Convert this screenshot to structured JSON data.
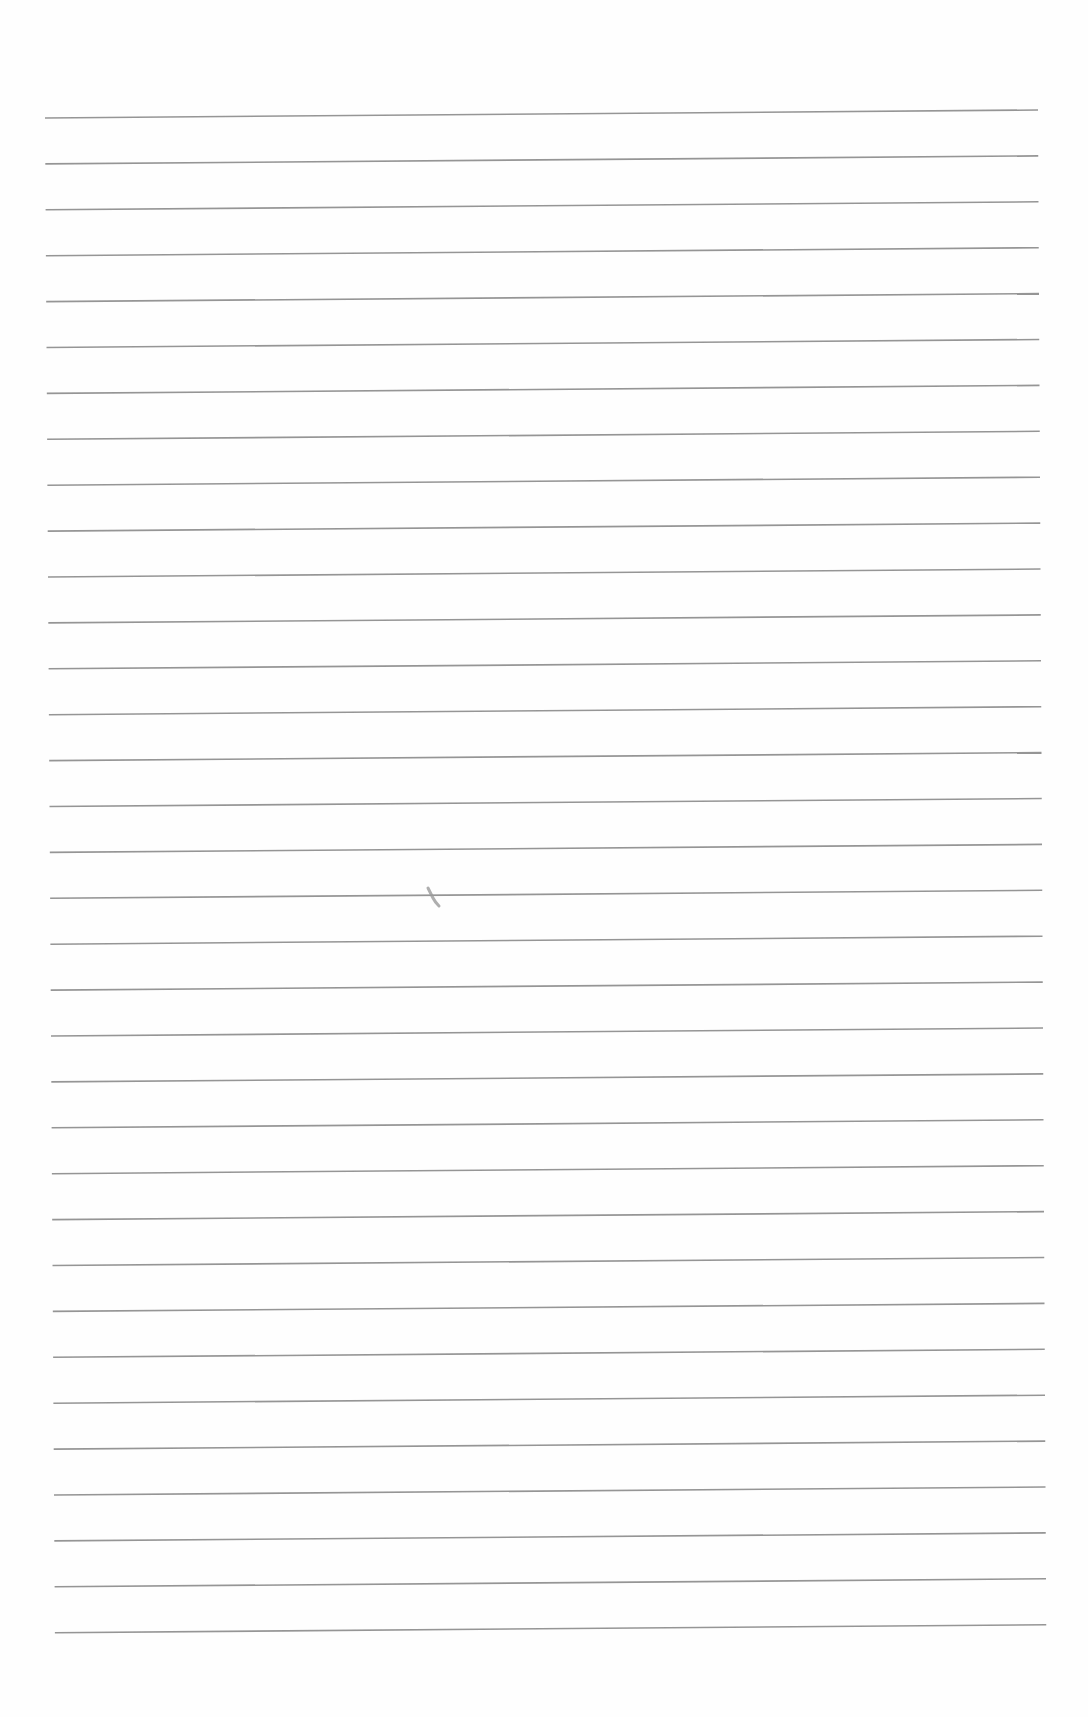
{
  "page": {
    "type": "lined-notebook-paper",
    "background_color": "#fefefe",
    "rule_color": "#8a8a8a",
    "rule_count": 34,
    "rule_spacing_px": 45.9,
    "first_rule_y_left": 118,
    "first_rule_y_right": 110,
    "rule_x_start": 45,
    "rule_x_end": 1038,
    "content_text": ""
  },
  "marks": [
    {
      "name": "pencil-stray-mark",
      "x": 428,
      "y": 888,
      "color": "#9a9a9a"
    }
  ]
}
